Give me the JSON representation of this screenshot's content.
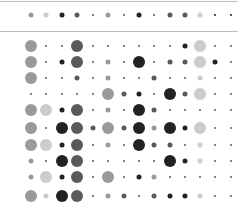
{
  "chart_data": {
    "type": "heatmap",
    "title": "",
    "subtitle": "",
    "xlabel": "",
    "ylabel": "",
    "grid": false,
    "legend": "none",
    "encoding": "dot matrix; size and shade encode magnitude",
    "size_scale": {
      "t": 2,
      "s": 5,
      "m": 8,
      "l": 12
    },
    "shade_scale": {
      "k": "#222222",
      "d": "#5a5a5a",
      "g": "#9a9a9a",
      "l": "#cccccc"
    },
    "columns_x": [
      31,
      46,
      62,
      77,
      93,
      108,
      124,
      139,
      154,
      170,
      185,
      200,
      215,
      231
    ],
    "summary_row": {
      "y": 15,
      "cells": [
        [
          "s",
          "g"
        ],
        [
          "s",
          "l"
        ],
        [
          "s",
          "k"
        ],
        [
          "s",
          "d"
        ],
        [
          "t",
          "d"
        ],
        [
          "s",
          "g"
        ],
        [
          "t",
          "d"
        ],
        [
          "s",
          "k"
        ],
        [
          "t",
          "d"
        ],
        [
          "s",
          "d"
        ],
        [
          "s",
          "d"
        ],
        [
          "s",
          "l"
        ],
        [
          "t",
          "k"
        ],
        [
          "t",
          "k"
        ]
      ]
    },
    "rows_y": [
      46,
      62,
      78,
      94,
      110,
      128,
      145,
      161,
      177,
      196
    ],
    "rows": [
      [
        [
          "l",
          "g"
        ],
        [
          "t",
          "d"
        ],
        [
          "t",
          "d"
        ],
        [
          "l",
          "d"
        ],
        [
          "t",
          "d"
        ],
        [
          "t",
          "d"
        ],
        [
          "t",
          "d"
        ],
        [
          "t",
          "d"
        ],
        [
          "t",
          "d"
        ],
        [
          "t",
          "d"
        ],
        [
          "s",
          "k"
        ],
        [
          "l",
          "l"
        ],
        [
          "t",
          "d"
        ],
        [
          "t",
          "d"
        ]
      ],
      [
        [
          "l",
          "g"
        ],
        [
          "t",
          "d"
        ],
        [
          "s",
          "k"
        ],
        [
          "l",
          "d"
        ],
        [
          "t",
          "d"
        ],
        [
          "s",
          "g"
        ],
        [
          "t",
          "d"
        ],
        [
          "l",
          "k"
        ],
        [
          "t",
          "d"
        ],
        [
          "s",
          "d"
        ],
        [
          "s",
          "d"
        ],
        [
          "l",
          "l"
        ],
        [
          "s",
          "k"
        ],
        [
          "t",
          "d"
        ]
      ],
      [
        [
          "l",
          "g"
        ],
        [
          "t",
          "d"
        ],
        [
          "t",
          "d"
        ],
        [
          "s",
          "d"
        ],
        [
          "t",
          "d"
        ],
        [
          "s",
          "g"
        ],
        [
          "t",
          "d"
        ],
        [
          "t",
          "d"
        ],
        [
          "s",
          "d"
        ],
        [
          "t",
          "d"
        ],
        [
          "t",
          "d"
        ],
        [
          "s",
          "l"
        ],
        [
          "t",
          "d"
        ],
        [
          "t",
          "d"
        ]
      ],
      [
        [
          "t",
          "d"
        ],
        [
          "t",
          "d"
        ],
        [
          "t",
          "d"
        ],
        [
          "t",
          "d"
        ],
        [
          "t",
          "d"
        ],
        [
          "l",
          "g"
        ],
        [
          "s",
          "d"
        ],
        [
          "s",
          "k"
        ],
        [
          "t",
          "d"
        ],
        [
          "l",
          "k"
        ],
        [
          "s",
          "d"
        ],
        [
          "l",
          "l"
        ],
        [
          "t",
          "d"
        ],
        [
          "t",
          "d"
        ]
      ],
      [
        [
          "l",
          "g"
        ],
        [
          "l",
          "l"
        ],
        [
          "s",
          "k"
        ],
        [
          "l",
          "d"
        ],
        [
          "t",
          "d"
        ],
        [
          "s",
          "g"
        ],
        [
          "t",
          "d"
        ],
        [
          "l",
          "k"
        ],
        [
          "s",
          "d"
        ],
        [
          "t",
          "d"
        ],
        [
          "t",
          "d"
        ],
        [
          "t",
          "d"
        ],
        [
          "t",
          "d"
        ],
        [
          "t",
          "d"
        ]
      ],
      [
        [
          "l",
          "g"
        ],
        [
          "t",
          "d"
        ],
        [
          "l",
          "k"
        ],
        [
          "l",
          "d"
        ],
        [
          "s",
          "d"
        ],
        [
          "l",
          "g"
        ],
        [
          "s",
          "d"
        ],
        [
          "l",
          "k"
        ],
        [
          "s",
          "g"
        ],
        [
          "l",
          "k"
        ],
        [
          "s",
          "k"
        ],
        [
          "l",
          "l"
        ],
        [
          "t",
          "d"
        ],
        [
          "t",
          "d"
        ]
      ],
      [
        [
          "l",
          "g"
        ],
        [
          "l",
          "l"
        ],
        [
          "s",
          "k"
        ],
        [
          "l",
          "d"
        ],
        [
          "t",
          "d"
        ],
        [
          "s",
          "g"
        ],
        [
          "t",
          "d"
        ],
        [
          "l",
          "k"
        ],
        [
          "s",
          "d"
        ],
        [
          "s",
          "d"
        ],
        [
          "t",
          "d"
        ],
        [
          "s",
          "l"
        ],
        [
          "t",
          "d"
        ],
        [
          "t",
          "d"
        ]
      ],
      [
        [
          "s",
          "g"
        ],
        [
          "t",
          "d"
        ],
        [
          "l",
          "k"
        ],
        [
          "l",
          "d"
        ],
        [
          "t",
          "d"
        ],
        [
          "t",
          "d"
        ],
        [
          "t",
          "d"
        ],
        [
          "t",
          "d"
        ],
        [
          "t",
          "d"
        ],
        [
          "l",
          "k"
        ],
        [
          "s",
          "k"
        ],
        [
          "s",
          "l"
        ],
        [
          "t",
          "d"
        ],
        [
          "t",
          "d"
        ]
      ],
      [
        [
          "s",
          "g"
        ],
        [
          "l",
          "l"
        ],
        [
          "s",
          "k"
        ],
        [
          "l",
          "d"
        ],
        [
          "t",
          "d"
        ],
        [
          "l",
          "g"
        ],
        [
          "t",
          "d"
        ],
        [
          "s",
          "k"
        ],
        [
          "s",
          "g"
        ],
        [
          "t",
          "d"
        ],
        [
          "t",
          "d"
        ],
        [
          "t",
          "d"
        ],
        [
          "t",
          "d"
        ],
        [
          "t",
          "d"
        ]
      ],
      [
        [
          "l",
          "g"
        ],
        [
          "s",
          "l"
        ],
        [
          "l",
          "k"
        ],
        [
          "l",
          "d"
        ],
        [
          "t",
          "d"
        ],
        [
          "s",
          "g"
        ],
        [
          "s",
          "d"
        ],
        [
          "t",
          "d"
        ],
        [
          "s",
          "d"
        ],
        [
          "s",
          "k"
        ],
        [
          "s",
          "k"
        ],
        [
          "s",
          "l"
        ],
        [
          "t",
          "d"
        ],
        [
          "t",
          "d"
        ]
      ]
    ],
    "dividers_y": [
      1,
      31
    ]
  }
}
